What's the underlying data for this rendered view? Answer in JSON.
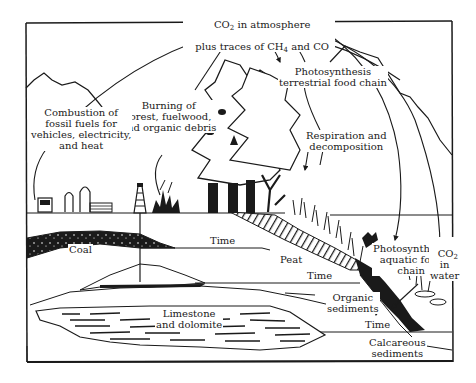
{
  "diagram": {
    "labels": {
      "atmosphere_line1_pre": "CO",
      "atmosphere_line1_sub": "2",
      "atmosphere_line1_post": " in atmosphere",
      "atmosphere_line2_pre": "plus traces of CH",
      "atmosphere_line2_sub": "4",
      "atmosphere_line2_post": " and CO",
      "photosynthesis_terrestrial": "Photosynthesis\nterrestrial food chain",
      "burning": "Burning of\nforest, fuelwood,\nand organic debris",
      "combustion": "Combustion of\nfossil fuels for\nvehicles, electricity,\nand heat",
      "respiration": "Respiration and\ndecomposition",
      "photosynthesis_aquatic": "Photosynthesis\naquatic food\nchain",
      "co2_water_pre": "CO",
      "co2_water_sub": "2",
      "co2_water_rest": "in\nwater",
      "coal": "Coal",
      "peat": "Peat",
      "time_1": "Time",
      "time_2": "Time",
      "time_3": "Time",
      "organic_sediments": "Organic\nsediments",
      "limestone": "Limestone\nand dolomite",
      "calcareous": "Calcareous\nsediments"
    },
    "colors": {
      "ink": "#1a1a1a",
      "paper": "#ffffff"
    }
  }
}
